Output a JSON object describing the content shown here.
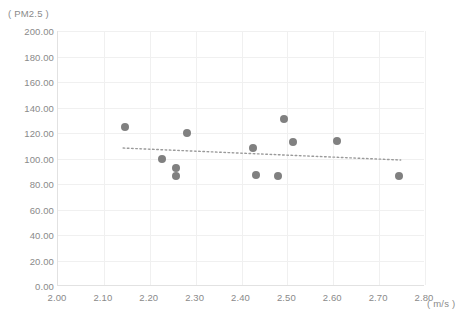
{
  "chart_data": {
    "type": "scatter",
    "title": "",
    "ylabel": "( PM2.5 )",
    "xlabel": "( m/s )",
    "xlim": [
      2.0,
      2.8
    ],
    "ylim": [
      0.0,
      200.0
    ],
    "grid": true,
    "legend": false,
    "xticks": [
      "2.00",
      "2.10",
      "2.20",
      "2.30",
      "2.40",
      "2.50",
      "2.60",
      "2.70",
      "2.80"
    ],
    "xtick_values": [
      2.0,
      2.1,
      2.2,
      2.3,
      2.4,
      2.5,
      2.6,
      2.7,
      2.8
    ],
    "yticks": [
      "0.00",
      "20.00",
      "40.00",
      "60.00",
      "80.00",
      "100.00",
      "120.00",
      "140.00",
      "160.00",
      "180.00",
      "200.00"
    ],
    "ytick_values": [
      0,
      20,
      40,
      60,
      80,
      100,
      120,
      140,
      160,
      180,
      200
    ],
    "marker_color": "#808080",
    "grid_color": "#f0f0f0",
    "axis_color": "#e2e2e2",
    "tick_label_color": "#8a8a8a",
    "series": [
      {
        "name": "PM2.5 vs wind speed",
        "points": [
          {
            "x": 2.146,
            "y": 124.7
          },
          {
            "x": 2.226,
            "y": 99.6
          },
          {
            "x": 2.258,
            "y": 92.5
          },
          {
            "x": 2.258,
            "y": 86.3
          },
          {
            "x": 2.281,
            "y": 120.0
          },
          {
            "x": 2.425,
            "y": 108.2
          },
          {
            "x": 2.431,
            "y": 87.1
          },
          {
            "x": 2.48,
            "y": 86.3
          },
          {
            "x": 2.492,
            "y": 131.0
          },
          {
            "x": 2.512,
            "y": 113.3
          },
          {
            "x": 2.608,
            "y": 113.7
          },
          {
            "x": 2.743,
            "y": 86.3
          }
        ]
      }
    ],
    "trendline": {
      "type": "linear-dotted",
      "color": "#9a9a9a",
      "x_start": 2.142,
      "y_start": 108.2,
      "x_end": 2.747,
      "y_end": 98.8
    }
  }
}
